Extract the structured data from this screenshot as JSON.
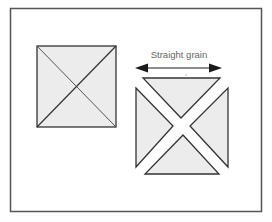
{
  "figure": {
    "label_straight_grain": "Straight grain",
    "caption_visible_fragment": "",
    "colors": {
      "background": "#ffffff",
      "frame_stroke": "#555555",
      "shape_fill": "#ececec",
      "shape_stroke": "#333333",
      "diagonal_stroke": "#444444",
      "arrow": "#1a1a1a",
      "label_text": "#666666"
    },
    "frame": {
      "x": 10,
      "y": 8,
      "width": 251,
      "height": 203
    },
    "uncut_square": {
      "x": 37,
      "y": 46,
      "width": 79,
      "height": 81
    },
    "arrow": {
      "x1": 135,
      "x2": 222,
      "y": 68
    },
    "cut_triangles": [
      {
        "name": "top",
        "points": "143,78 220,78 181,118"
      },
      {
        "name": "left",
        "points": "136,88 173,126 136,167"
      },
      {
        "name": "right",
        "points": "228,88 228,167 190,126"
      },
      {
        "name": "bottom",
        "points": "145,174 219,174 183,135"
      }
    ]
  }
}
